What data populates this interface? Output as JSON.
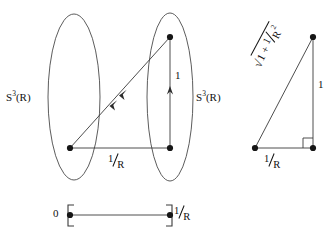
{
  "figure": {
    "background_color": "#ffffff",
    "stroke_color": "#3a3a3a",
    "text_color": "#111111",
    "labels": {
      "sphere_left": "S3(R)",
      "sphere_left_base": "S",
      "sphere_left_exponent": "3",
      "sphere_left_arg": "(R)",
      "sphere_right_base": "S",
      "sphere_right_exponent": "3",
      "sphere_right_arg": "(R)",
      "vertical_unit_middle": "1",
      "horizontal_invR_middle_num": "1",
      "horizontal_invR_middle_den": "R",
      "triangle_vertical_unit": "1",
      "triangle_base_invR_num": "1",
      "triangle_base_invR_den": "R",
      "hypotenuse_sqrt_symbol": "√",
      "hypotenuse_inside_lead": "1 + ",
      "hypotenuse_inside_frac_num": "1",
      "hypotenuse_inside_frac_den": "R",
      "hypotenuse_inside_exponent": "2",
      "interval_start": "0",
      "interval_end_num": "1",
      "interval_end_den": "R"
    },
    "geometry": {
      "left_ellipse": {
        "cx": 74,
        "cy": 97,
        "rx": 26,
        "ry": 83
      },
      "right_ellipse": {
        "cx": 170,
        "cy": 97,
        "rx": 23,
        "ry": 84
      },
      "node_left_bottom": {
        "x": 70,
        "y": 148
      },
      "node_right_bottom": {
        "x": 170,
        "y": 148
      },
      "node_right_top": {
        "x": 170,
        "y": 37
      },
      "triangle_apex": {
        "x": 313,
        "y": 37
      },
      "triangle_left": {
        "x": 255,
        "y": 148
      },
      "triangle_right": {
        "x": 313,
        "y": 148
      },
      "interval_left": {
        "x": 70,
        "y": 215
      },
      "interval_right": {
        "x": 170,
        "y": 215
      }
    }
  }
}
